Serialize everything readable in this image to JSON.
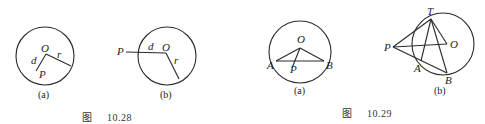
{
  "figures": [
    {
      "caption": {
        "prefix": "图",
        "number": "10.28"
      },
      "subfigures": [
        {
          "label": "(a)",
          "points": {
            "O": "O",
            "P": "P",
            "d": "d",
            "r": "r"
          }
        },
        {
          "label": "(b)",
          "points": {
            "O": "O",
            "P": "P",
            "d": "d",
            "r": "r"
          }
        }
      ]
    },
    {
      "caption": {
        "prefix": "图",
        "number": "10.29"
      },
      "subfigures": [
        {
          "label": "(a)",
          "points": {
            "O": "O",
            "A": "A",
            "P": "P",
            "B": "B"
          }
        },
        {
          "label": "(b)",
          "points": {
            "T": "T",
            "P": "P",
            "O": "O",
            "A": "A",
            "B": "B"
          }
        }
      ]
    }
  ]
}
